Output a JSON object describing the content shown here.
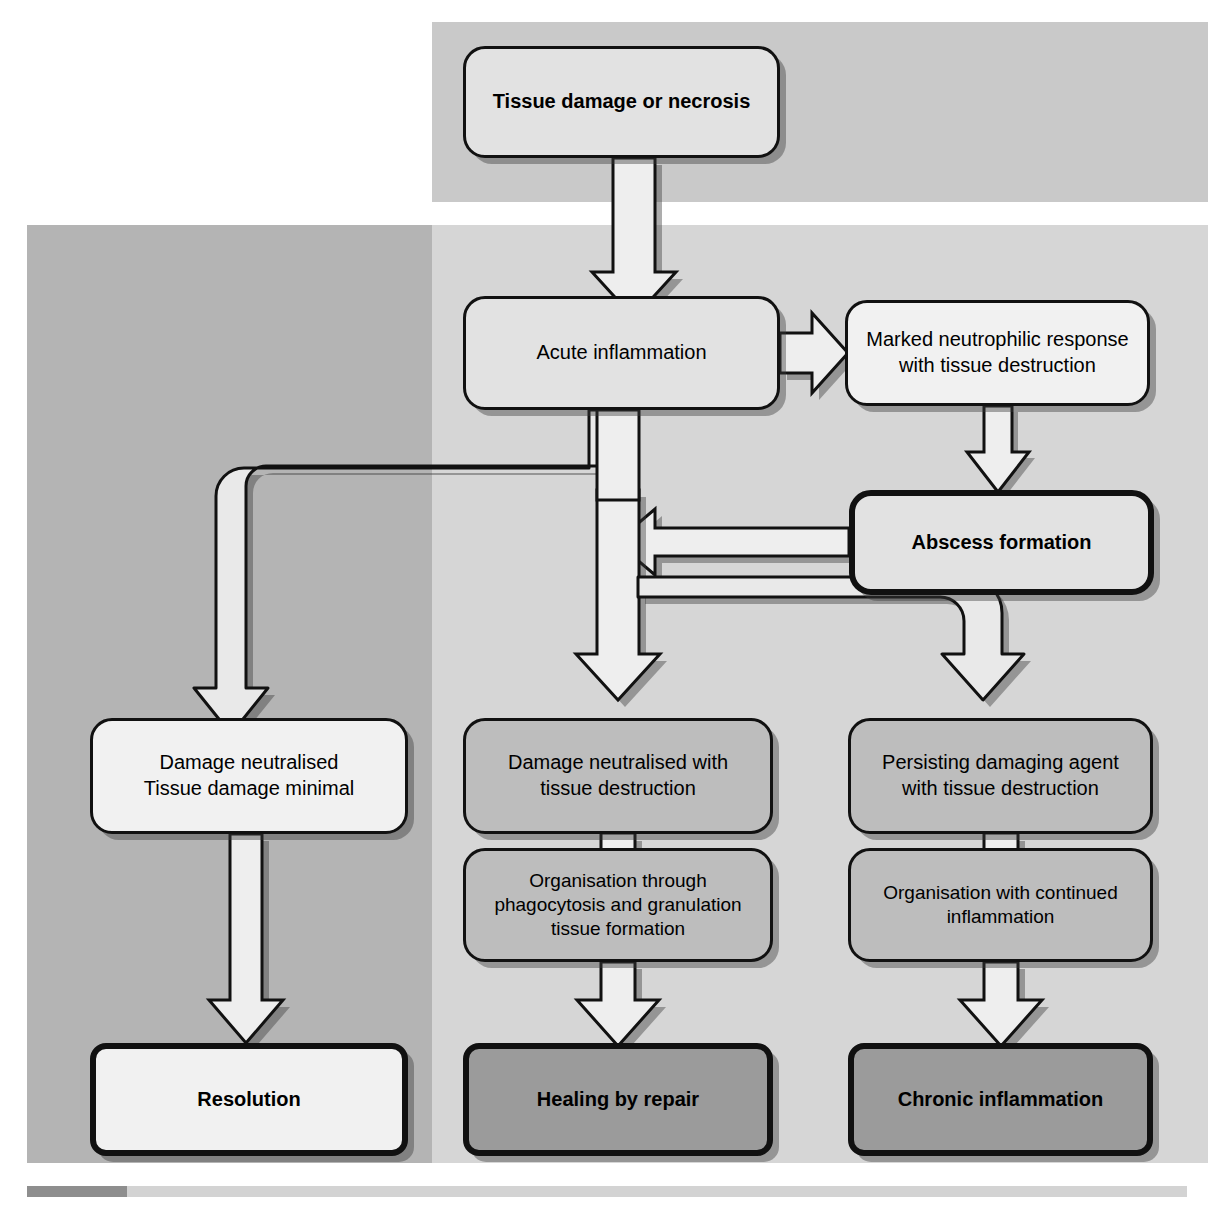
{
  "diagram": {
    "type": "flowchart",
    "palette": {
      "panel_top": "#c9c9c9",
      "panel_left": "#b4b4b4",
      "panel_right": "#d6d6d6",
      "box_lightest": "#f1f1f1",
      "box_light": "#e2e2e2",
      "box_mid": "#bdbdbd",
      "box_dark": "#9b9b9b",
      "stroke": "#111111",
      "shadow": "#3c3c3c"
    },
    "nodes": {
      "tissue_damage": "Tissue damage or necrosis",
      "acute_inflammation": "Acute inflammation",
      "marked_neutrophilic_line1": "Marked neutrophilic response",
      "marked_neutrophilic_line2": "with tissue destruction",
      "abscess_formation": "Abscess formation",
      "damage_minimal_line1": "Damage neutralised",
      "damage_minimal_line2": "Tissue damage minimal",
      "damage_destruction_line1": "Damage neutralised with",
      "damage_destruction_line2": "tissue destruction",
      "persisting_agent_line1": "Persisting damaging agent",
      "persisting_agent_line2": "with tissue destruction",
      "organisation_phago_line1": "Organisation through",
      "organisation_phago_line2": "phagocytosis and granulation",
      "organisation_phago_line3": "tissue formation",
      "organisation_continued_line1": "Organisation with continued",
      "organisation_continued_line2": "inflammation",
      "resolution": "Resolution",
      "healing_by_repair": "Healing by repair",
      "chronic_inflammation": "Chronic inflammation"
    },
    "edges": [
      {
        "from": "tissue_damage",
        "to": "acute_inflammation",
        "style": "block-arrow-down"
      },
      {
        "from": "acute_inflammation",
        "to": "marked_neutrophilic",
        "style": "block-arrow-right"
      },
      {
        "from": "marked_neutrophilic",
        "to": "abscess_formation",
        "style": "block-arrow-down"
      },
      {
        "from": "abscess_formation",
        "to": "acute-inflammation-return-bus",
        "style": "block-arrow-left"
      },
      {
        "from": "acute_inflammation",
        "to": "damage_minimal",
        "style": "block-arrow-down-left-elbow"
      },
      {
        "from": "acute_inflammation",
        "to": "damage_destruction",
        "style": "block-arrow-down"
      },
      {
        "from": "abscess_formation",
        "to": "persisting_agent",
        "style": "block-arrow-down-right-elbow"
      },
      {
        "from": "damage_minimal",
        "to": "resolution",
        "style": "block-arrow-down"
      },
      {
        "from": "damage_destruction",
        "to": "organisation_phago",
        "style": "connector-step"
      },
      {
        "from": "persisting_agent",
        "to": "organisation_continued",
        "style": "connector-step"
      },
      {
        "from": "organisation_phago",
        "to": "healing_by_repair",
        "style": "block-arrow-down"
      },
      {
        "from": "organisation_continued",
        "to": "chronic_inflammation",
        "style": "block-arrow-down"
      }
    ]
  }
}
